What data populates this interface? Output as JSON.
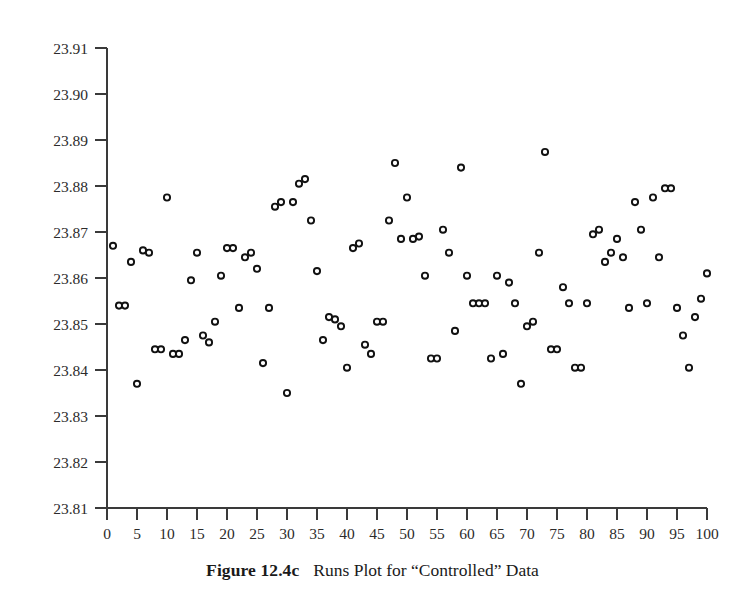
{
  "caption": {
    "label": "Figure 12.4c",
    "title": "Runs Plot for “Controlled” Data"
  },
  "chart_data": {
    "type": "scatter",
    "title": "Runs Plot for “Controlled” Data",
    "xlabel": "",
    "ylabel": "",
    "xlim": [
      0,
      100
    ],
    "ylim": [
      23.81,
      23.91
    ],
    "grid": false,
    "legend": null,
    "marker": "open-circle",
    "xticks": [
      0,
      5,
      10,
      15,
      20,
      25,
      30,
      35,
      40,
      45,
      50,
      55,
      60,
      65,
      70,
      75,
      80,
      85,
      90,
      95,
      100
    ],
    "xtick_labels": [
      "0",
      "5",
      "10",
      "15",
      "20",
      "25",
      "30",
      "35",
      "40",
      "45",
      "50",
      "55",
      "60",
      "65",
      "70",
      "75",
      "80",
      "85",
      "90",
      "95",
      "100"
    ],
    "yticks": [
      23.81,
      23.82,
      23.83,
      23.84,
      23.85,
      23.86,
      23.87,
      23.88,
      23.89,
      23.9,
      23.91
    ],
    "ytick_labels": [
      "23.81",
      "23.82",
      "23.83",
      "23.84",
      "23.85",
      "23.86",
      "23.87",
      "23.88",
      "23.89",
      "23.90",
      "23.91"
    ],
    "x": [
      1,
      2,
      3,
      4,
      5,
      6,
      7,
      8,
      9,
      10,
      11,
      12,
      13,
      14,
      15,
      16,
      17,
      18,
      19,
      20,
      21,
      22,
      23,
      24,
      25,
      26,
      27,
      28,
      29,
      30,
      31,
      32,
      33,
      34,
      35,
      36,
      37,
      38,
      39,
      40,
      41,
      42,
      43,
      44,
      45,
      46,
      47,
      48,
      49,
      50,
      51,
      52,
      53,
      54,
      55,
      56,
      57,
      58,
      59,
      60,
      61,
      62,
      63,
      64,
      65,
      66,
      67,
      68,
      69,
      70,
      71,
      72,
      73,
      74,
      75,
      76,
      77,
      78,
      79,
      80,
      81,
      82,
      83,
      84,
      85,
      86,
      87,
      88,
      89,
      90,
      91,
      92,
      93,
      94,
      95,
      96,
      97,
      98,
      99,
      100
    ],
    "y": [
      23.867,
      23.854,
      23.854,
      23.8635,
      23.837,
      23.866,
      23.8655,
      23.8445,
      23.8445,
      23.8775,
      23.8435,
      23.8435,
      23.8465,
      23.8595,
      23.8655,
      23.8475,
      23.846,
      23.8505,
      23.8605,
      23.8665,
      23.8665,
      23.8535,
      23.8645,
      23.8655,
      23.862,
      23.8415,
      23.8535,
      23.8755,
      23.8765,
      23.835,
      23.8765,
      23.8805,
      23.8815,
      23.8725,
      23.8615,
      23.8465,
      23.8515,
      23.851,
      23.8495,
      23.8405,
      23.8665,
      23.8675,
      23.8455,
      23.8435,
      23.8505,
      23.8505,
      23.8725,
      23.885,
      23.8685,
      23.8775,
      23.8685,
      23.869,
      23.8605,
      23.8425,
      23.8425,
      23.8705,
      23.8655,
      23.8485,
      23.884,
      23.8605,
      23.8545,
      23.8545,
      23.8545,
      23.8425,
      23.8605,
      23.8435,
      23.859,
      23.8545,
      23.837,
      23.8495,
      23.8505,
      23.8655,
      23.8874,
      23.8445,
      23.8445,
      23.858,
      23.8545,
      23.8405,
      23.8405,
      23.8545,
      23.8695,
      23.8705,
      23.8635,
      23.8655,
      23.8685,
      23.8645,
      23.8535,
      23.8765,
      23.8705,
      23.8545,
      23.8775,
      23.8645,
      23.8795,
      23.8795,
      23.8535,
      23.8475,
      23.8405,
      23.8515,
      23.8555,
      23.861
    ]
  }
}
